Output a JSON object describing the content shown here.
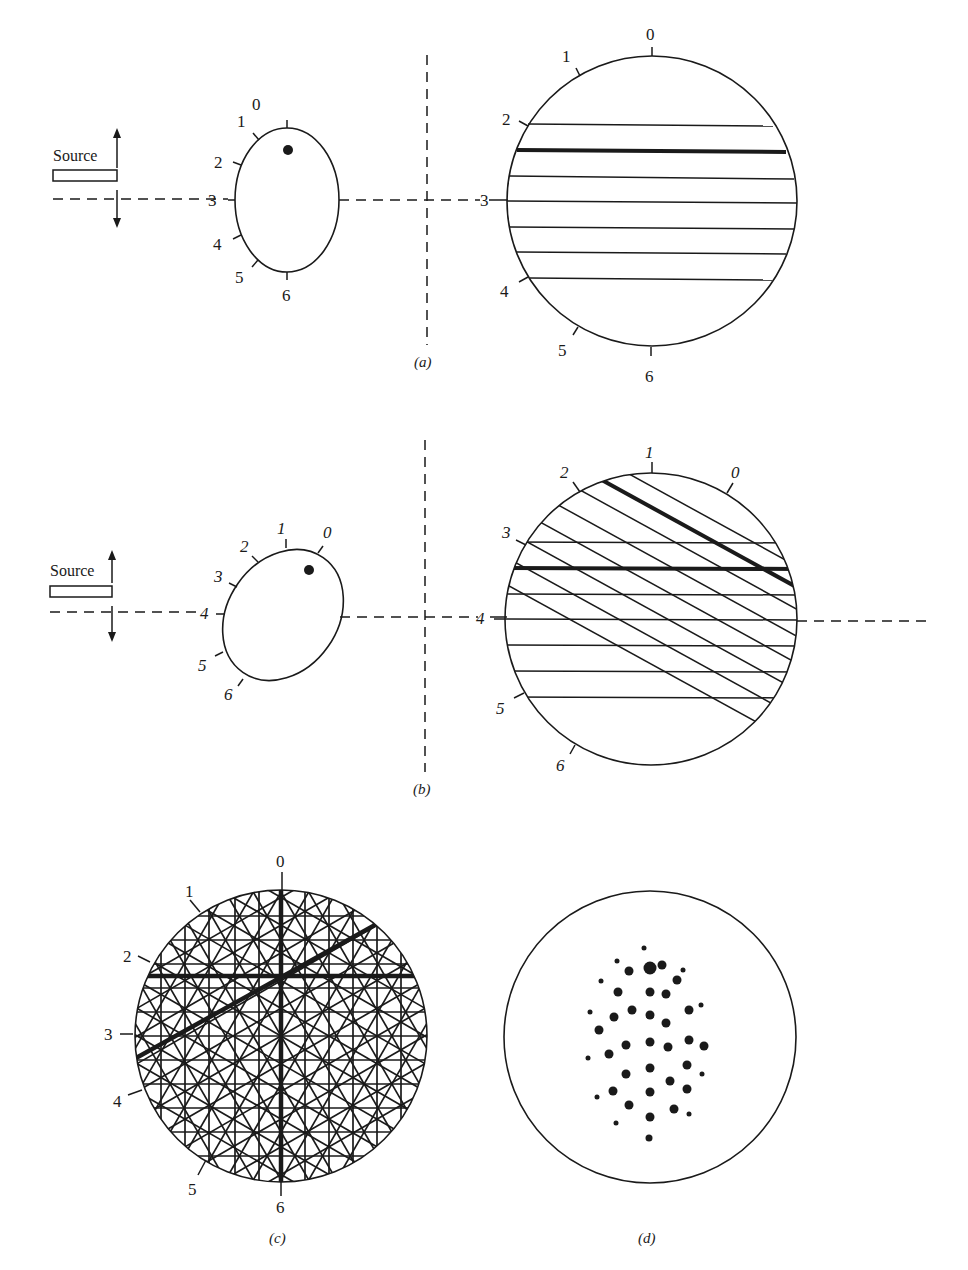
{
  "figure": {
    "panels": [
      {
        "id": "a",
        "caption": "(a)",
        "source_label": "Source",
        "crystal_ticks": [
          "0",
          "1",
          "2",
          "3",
          "4",
          "5",
          "6"
        ],
        "pattern_ticks": [
          "0",
          "1",
          "2",
          "3",
          "4",
          "5",
          "6"
        ],
        "crystal_ellipse": {
          "cx": 287,
          "cy": 200,
          "rx": 52,
          "ry": 72,
          "rotate": 0
        },
        "crystal_dot": {
          "cx": 288,
          "cy": 150,
          "r": 5
        },
        "pattern_circle": {
          "cx": 652,
          "cy": 201,
          "r": 145
        },
        "horizontal_lines_y": [
          124,
          150,
          176,
          201,
          227,
          253,
          278
        ],
        "thick_line_index": 1
      },
      {
        "id": "b",
        "caption": "(b)",
        "source_label": "Source",
        "crystal_ticks": [
          "0",
          "1",
          "2",
          "3",
          "4",
          "5",
          "6"
        ],
        "pattern_ticks": [
          "0",
          "1",
          "2",
          "3",
          "4",
          "5",
          "6"
        ],
        "crystal_ellipse": {
          "cx": 283,
          "cy": 615,
          "rx": 55,
          "ry": 70,
          "rotate": 35
        },
        "crystal_dot": {
          "cx": 309,
          "cy": 570,
          "r": 5
        },
        "pattern_circle": {
          "cx": 651,
          "cy": 619,
          "r": 146
        },
        "horizontal_lines_y": [
          542,
          568,
          594,
          619,
          645,
          671,
          697
        ],
        "thick_horizontal_index": 1,
        "diagonal_angle_deg": -30,
        "diagonal_offsets": [
          -125,
          -100,
          -75,
          -50,
          -25,
          0,
          25,
          50
        ],
        "thick_diagonal_index": 1
      },
      {
        "id": "c",
        "caption": "(c)",
        "pattern_ticks": [
          "0",
          "1",
          "2",
          "3",
          "4",
          "5",
          "6"
        ],
        "pattern_circle": {
          "cx": 281,
          "cy": 1036,
          "r": 146
        },
        "line_families_deg": [
          0,
          30,
          60,
          90,
          120,
          150
        ],
        "line_spacing": 24,
        "thick_lines": [
          {
            "angle": 0,
            "offset": -61
          },
          {
            "angle": 90,
            "offset": 0
          },
          {
            "angle": 150,
            "offset": -20
          }
        ]
      },
      {
        "id": "d",
        "caption": "(d)",
        "pattern_circle": {
          "cx": 650,
          "cy": 1037,
          "r": 146
        },
        "spots": [
          [
            644,
            948,
            2.5
          ],
          [
            617,
            961,
            2.5
          ],
          [
            650,
            968,
            6.5
          ],
          [
            662,
            965,
            4.5
          ],
          [
            629,
            971,
            4.5
          ],
          [
            683,
            970,
            2.5
          ],
          [
            601,
            981,
            2.5
          ],
          [
            677,
            980,
            4.5
          ],
          [
            618,
            992,
            4.5
          ],
          [
            650,
            992,
            4.5
          ],
          [
            666,
            994,
            4.5
          ],
          [
            590,
            1012,
            2.5
          ],
          [
            632,
            1010,
            4.5
          ],
          [
            650,
            1015,
            4.5
          ],
          [
            689,
            1010,
            4.5
          ],
          [
            701,
            1005,
            2.5
          ],
          [
            614,
            1017,
            4.5
          ],
          [
            666,
            1023,
            4.5
          ],
          [
            599,
            1030,
            4.5
          ],
          [
            626,
            1045,
            4.5
          ],
          [
            650,
            1042,
            4.5
          ],
          [
            668,
            1047,
            4.5
          ],
          [
            689,
            1040,
            4.5
          ],
          [
            704,
            1046,
            4.5
          ],
          [
            588,
            1058,
            2.5
          ],
          [
            609,
            1054,
            4.5
          ],
          [
            650,
            1068,
            4.5
          ],
          [
            687,
            1065,
            4.5
          ],
          [
            626,
            1074,
            4.5
          ],
          [
            702,
            1074,
            2.5
          ],
          [
            670,
            1081,
            4.5
          ],
          [
            613,
            1091,
            4.5
          ],
          [
            650,
            1092,
            4.5
          ],
          [
            687,
            1089,
            4.5
          ],
          [
            597,
            1097,
            2.5
          ],
          [
            629,
            1105,
            4.5
          ],
          [
            674,
            1109,
            4.5
          ],
          [
            689,
            1114,
            2.5
          ],
          [
            616,
            1123,
            2.5
          ],
          [
            650,
            1117,
            4.5
          ],
          [
            649,
            1138,
            3.5
          ]
        ]
      }
    ]
  }
}
